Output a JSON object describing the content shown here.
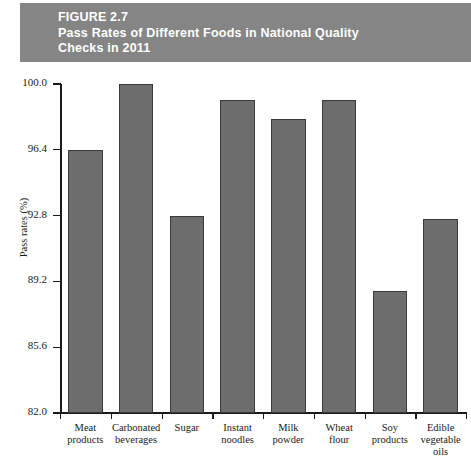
{
  "figure": {
    "banner_lines": [
      "FIGURE 2.7",
      "Pass Rates of Different Foods in National Quality",
      "Checks in 2011"
    ],
    "banner_color": "#858585",
    "banner_text_color": "#ffffff"
  },
  "chart_data": {
    "type": "bar",
    "title": "Pass Rates of Different Foods in National Quality Checks in 2011",
    "xlabel": "",
    "ylabel": "Pass rates (%)",
    "ylim": [
      82.0,
      100.0
    ],
    "ytick_labels": [
      "100.0",
      "96.4",
      "92.8",
      "89.2",
      "85.6",
      "82.0"
    ],
    "ytick_values": [
      100.0,
      96.4,
      92.8,
      89.2,
      85.6,
      82.0
    ],
    "grid": false,
    "legend": false,
    "bar_color": "#6d6d6d",
    "bar_edge_color": "#3a3a3a",
    "categories": [
      "Meat products",
      "Carbonated beverages",
      "Sugar",
      "Instant noodles",
      "Milk powder",
      "Wheat flour",
      "Soy products",
      "Edible vegetable oils"
    ],
    "category_lines": [
      [
        "Meat",
        "products"
      ],
      [
        "Carbonated",
        "beverages"
      ],
      [
        "Sugar"
      ],
      [
        "Instant",
        "noodles"
      ],
      [
        "Milk",
        "powder"
      ],
      [
        "Wheat",
        "flour"
      ],
      [
        "Soy",
        "products"
      ],
      [
        "Edible",
        "vegetable",
        "oils"
      ]
    ],
    "values": [
      96.4,
      100.0,
      92.8,
      99.1,
      98.1,
      99.1,
      88.7,
      92.6
    ]
  },
  "caption": {
    "partial_text": ""
  }
}
